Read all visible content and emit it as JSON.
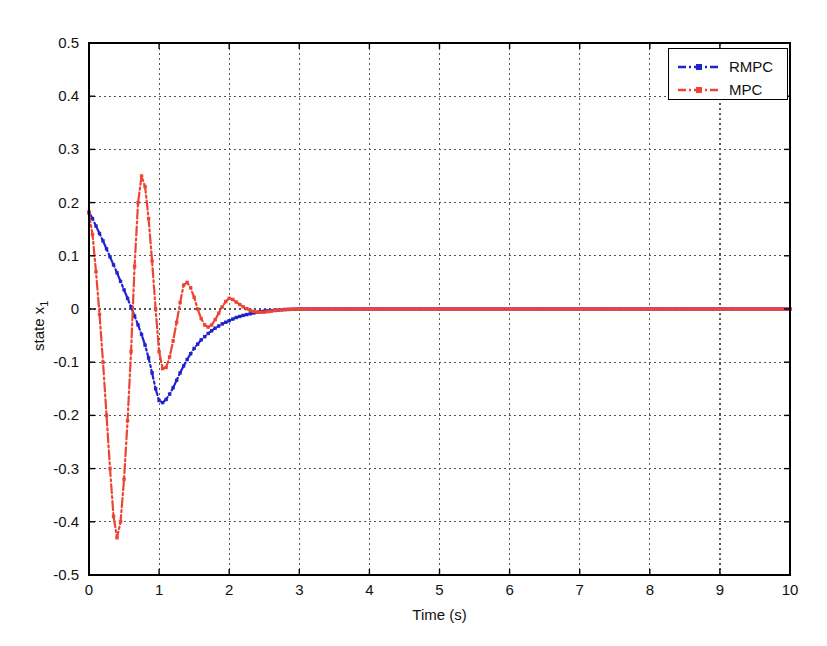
{
  "chart_data": {
    "type": "line",
    "title": "",
    "xlabel": "Time (s)",
    "ylabel": "state x_1",
    "ylabel_base": "state x",
    "ylabel_sub": "1",
    "xlim": [
      0,
      10
    ],
    "ylim": [
      -0.5,
      0.5
    ],
    "xticks": [
      0,
      1,
      2,
      3,
      4,
      5,
      6,
      7,
      8,
      9,
      10
    ],
    "xtick_labels": [
      "0",
      "1",
      "2",
      "3",
      "4",
      "5",
      "6",
      "7",
      "8",
      "9",
      "10"
    ],
    "yticks": [
      -0.5,
      -0.4,
      -0.3,
      -0.2,
      -0.1,
      0,
      0.1,
      0.2,
      0.3,
      0.4,
      0.5
    ],
    "ytick_labels": [
      "-0.5",
      "-0.4",
      "-0.3",
      "-0.2",
      "-0.1",
      "0",
      "0.1",
      "0.2",
      "0.3",
      "0.4",
      "0.5"
    ],
    "grid": true,
    "grid_style": "dotted",
    "grid_color": "#555555",
    "legend_position": "top-right",
    "series": [
      {
        "name": "RMPC",
        "color": "#2222cc",
        "linestyle": "dashdot",
        "marker": "square",
        "x": [
          0,
          0.05,
          0.1,
          0.15,
          0.2,
          0.25,
          0.3,
          0.35,
          0.4,
          0.45,
          0.5,
          0.55,
          0.6,
          0.65,
          0.7,
          0.75,
          0.8,
          0.85,
          0.9,
          0.95,
          1.0,
          1.05,
          1.1,
          1.15,
          1.2,
          1.25,
          1.3,
          1.35,
          1.4,
          1.45,
          1.5,
          1.6,
          1.7,
          1.8,
          1.9,
          2.0,
          2.1,
          2.2,
          2.3,
          2.4,
          2.5,
          2.6,
          2.7,
          2.8,
          3.0,
          3.5,
          4.0,
          5.0,
          6.0,
          7.0,
          8.0,
          9.0,
          10.0
        ],
        "y": [
          0.182,
          0.17,
          0.156,
          0.142,
          0.128,
          0.113,
          0.098,
          0.083,
          0.068,
          0.052,
          0.036,
          0.02,
          0.004,
          -0.013,
          -0.03,
          -0.048,
          -0.068,
          -0.092,
          -0.12,
          -0.15,
          -0.172,
          -0.176,
          -0.17,
          -0.16,
          -0.148,
          -0.134,
          -0.12,
          -0.107,
          -0.095,
          -0.084,
          -0.074,
          -0.058,
          -0.046,
          -0.036,
          -0.028,
          -0.022,
          -0.016,
          -0.012,
          -0.009,
          -0.006,
          -0.004,
          -0.003,
          -0.002,
          -0.001,
          0,
          0,
          0,
          0,
          0,
          0,
          0,
          0,
          0
        ]
      },
      {
        "name": "MPC",
        "color": "#ee4433",
        "linestyle": "dashdot",
        "marker": "square",
        "x": [
          0,
          0.05,
          0.1,
          0.15,
          0.2,
          0.25,
          0.3,
          0.35,
          0.4,
          0.45,
          0.5,
          0.55,
          0.6,
          0.65,
          0.7,
          0.75,
          0.8,
          0.85,
          0.9,
          0.95,
          1.0,
          1.05,
          1.1,
          1.15,
          1.2,
          1.25,
          1.3,
          1.35,
          1.4,
          1.45,
          1.5,
          1.55,
          1.6,
          1.65,
          1.7,
          1.75,
          1.8,
          1.85,
          1.9,
          1.95,
          2.0,
          2.05,
          2.1,
          2.2,
          2.3,
          2.4,
          2.5,
          2.6,
          2.7,
          2.8,
          3.0,
          3.5,
          4.0,
          5.0,
          6.0,
          7.0,
          8.0,
          9.0,
          10.0
        ],
        "y": [
          0.18,
          0.14,
          0.07,
          -0.01,
          -0.1,
          -0.2,
          -0.3,
          -0.39,
          -0.43,
          -0.4,
          -0.32,
          -0.21,
          -0.08,
          0.08,
          0.2,
          0.25,
          0.23,
          0.17,
          0.09,
          0.0,
          -0.08,
          -0.112,
          -0.11,
          -0.09,
          -0.06,
          -0.025,
          0.012,
          0.045,
          0.05,
          0.04,
          0.022,
          0.0,
          -0.018,
          -0.03,
          -0.034,
          -0.03,
          -0.02,
          -0.008,
          0.004,
          0.014,
          0.02,
          0.018,
          0.013,
          0.004,
          -0.003,
          -0.006,
          -0.006,
          -0.004,
          -0.002,
          -0.001,
          0,
          0,
          0,
          0,
          0,
          0,
          0,
          0,
          0
        ]
      }
    ]
  },
  "legend": {
    "entries": [
      {
        "label": "RMPC",
        "color": "#2222cc"
      },
      {
        "label": "MPC",
        "color": "#ee4433"
      }
    ]
  },
  "axes": {
    "frame_color": "#000000",
    "background": "#ffffff"
  }
}
